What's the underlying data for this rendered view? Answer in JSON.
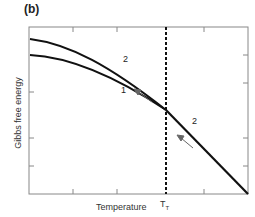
{
  "panel_label": "(b)",
  "axes": {
    "ylabel": "Gibbs free energy",
    "xlabel": "Temperature",
    "transition_label": "T",
    "transition_sub": "T"
  },
  "curves": [
    {
      "label": "1",
      "description": "lower curve at low temperature"
    },
    {
      "label": "2",
      "description": "upper curve at low temperature, continues past T_T"
    }
  ],
  "labels": {
    "curve1": "1",
    "curve2_upper": "2",
    "curve2_lower": "2"
  },
  "colors": {
    "line": "#111111",
    "frame": "#777777",
    "arrow": "#666666",
    "background": "#ffffff"
  }
}
